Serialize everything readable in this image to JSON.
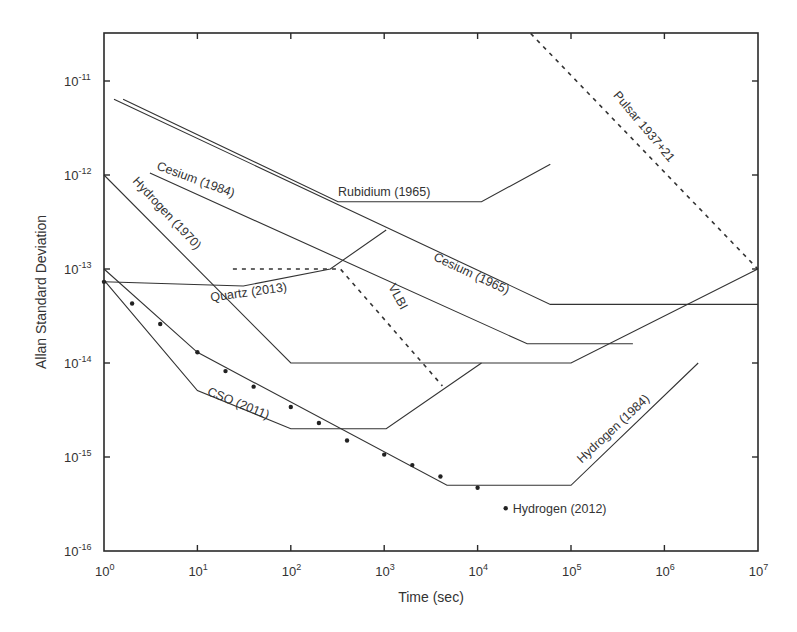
{
  "chart_data": {
    "type": "line",
    "title": "",
    "xlabel": "Time (sec)",
    "ylabel": "Allan Standard Deviation",
    "xscale": "log",
    "yscale": "log",
    "xlim": [
      1,
      10000000
    ],
    "ylim": [
      1e-16,
      3.2e-11
    ],
    "grid": false,
    "legend": "inline annotations",
    "x_ticks": [
      {
        "base": "10",
        "exp": "0",
        "value": 1
      },
      {
        "base": "10",
        "exp": "1",
        "value": 10
      },
      {
        "base": "10",
        "exp": "2",
        "value": 100
      },
      {
        "base": "10",
        "exp": "3",
        "value": 1000
      },
      {
        "base": "10",
        "exp": "4",
        "value": 10000
      },
      {
        "base": "10",
        "exp": "5",
        "value": 100000
      },
      {
        "base": "10",
        "exp": "6",
        "value": 1000000
      },
      {
        "base": "10",
        "exp": "7",
        "value": 10000000
      }
    ],
    "y_ticks": [
      {
        "base": "10",
        "exp": "-16",
        "value": 1e-16
      },
      {
        "base": "10",
        "exp": "-15",
        "value": 1e-15
      },
      {
        "base": "10",
        "exp": "-14",
        "value": 1e-14
      },
      {
        "base": "10",
        "exp": "-13",
        "value": 1e-13
      },
      {
        "base": "10",
        "exp": "-12",
        "value": 1e-12
      },
      {
        "base": "10",
        "exp": "-11",
        "value": 1e-11
      }
    ],
    "series": [
      {
        "name": "Cesium (1965)",
        "style": "solid",
        "points": [
          [
            1.28,
            6.4e-12
          ],
          [
            60000,
            4.2e-14
          ],
          [
            10000000,
            4.2e-14
          ]
        ],
        "label": {
          "text": "Cesium (1965)",
          "x": 3300,
          "y": 1.25e-13,
          "angle": 25
        }
      },
      {
        "name": "Rubidium (1965)",
        "style": "solid",
        "points": [
          [
            1.6,
            6.4e-12
          ],
          [
            320,
            5.2e-13
          ],
          [
            11000,
            5.2e-13
          ],
          [
            60000,
            1.3e-12
          ]
        ],
        "label": {
          "text": "Rubidium (1965)",
          "x": 320,
          "y": 6e-13,
          "angle": 0
        }
      },
      {
        "name": "Cesium (1984)",
        "style": "solid",
        "points": [
          [
            3.1,
            1.05e-12
          ],
          [
            34000,
            1.6e-14
          ],
          [
            460000,
            1.6e-14
          ]
        ],
        "label": {
          "text": "Cesium (1984)",
          "x": 3.6,
          "y": 1.15e-12,
          "angle": 20
        }
      },
      {
        "name": "Hydrogen (1970)",
        "style": "solid",
        "points": [
          [
            1,
            1e-12
          ],
          [
            100,
            1e-14
          ],
          [
            100000,
            1e-14
          ],
          [
            10000000,
            1e-13
          ]
        ],
        "label": {
          "text": "Hydrogen (1970)",
          "x": 2.0,
          "y": 8.5e-13,
          "angle": 47
        }
      },
      {
        "name": "Quartz (2013)",
        "style": "solid",
        "points": [
          [
            1,
            7.3e-14
          ],
          [
            31,
            6.6e-14
          ],
          [
            265,
            1e-13
          ],
          [
            1050,
            2.6e-13
          ]
        ],
        "label": {
          "text": "Quartz (2013)",
          "x": 14,
          "y": 4.5e-14,
          "angle": -8
        }
      },
      {
        "name": "VLBI",
        "style": "dashed",
        "points": [
          [
            24,
            1e-13
          ],
          [
            340,
            1e-13
          ],
          [
            4200,
            5.7e-15
          ]
        ],
        "label": {
          "text": "VLBI",
          "x": 1100,
          "y": 6.5e-14,
          "angle": 62
        }
      },
      {
        "name": "Pulsar 1937+21",
        "style": "dashed",
        "points": [
          [
            37000,
            3.2e-11
          ],
          [
            10000000,
            1e-13
          ]
        ],
        "label": {
          "text": "Pulsar 1937+21",
          "x": 280000,
          "y": 7e-12,
          "angle": 50
        }
      },
      {
        "name": "Hydrogen (1984)",
        "style": "solid",
        "points": [
          [
            1,
            1e-13
          ],
          [
            10,
            1.3e-14
          ],
          [
            4700,
            5e-16
          ],
          [
            100000,
            5e-16
          ],
          [
            2300000,
            1e-14
          ]
        ],
        "label": {
          "text": "Hydrogen (1984)",
          "x": 130000,
          "y": 8.5e-16,
          "angle": -43
        }
      },
      {
        "name": "CSO (2011)",
        "style": "solid",
        "points": [
          [
            1,
            7.6e-14
          ],
          [
            10,
            5.1e-15
          ],
          [
            100,
            2e-15
          ],
          [
            1050,
            2e-15
          ],
          [
            11000,
            1e-14
          ]
        ],
        "label": {
          "text": "CSO (2011)",
          "x": 12.5,
          "y": 4.6e-15,
          "angle": 22
        }
      }
    ],
    "scatter": {
      "name": "Hydrogen (2012)",
      "marker": "dot",
      "points": [
        [
          1,
          7.3e-14
        ],
        [
          2,
          4.3e-14
        ],
        [
          4,
          2.6e-14
        ],
        [
          10,
          1.3e-14
        ],
        [
          20,
          8.2e-15
        ],
        [
          40,
          5.6e-15
        ],
        [
          100,
          3.4e-15
        ],
        [
          200,
          2.3e-15
        ],
        [
          400,
          1.5e-15
        ],
        [
          1000,
          1.06e-15
        ],
        [
          2000,
          8.2e-16
        ],
        [
          4000,
          6.2e-16
        ],
        [
          10000,
          4.7e-16
        ]
      ],
      "label": {
        "text": "Hydrogen (2012)",
        "marker_x": 20000,
        "marker_y": 2.85e-16
      }
    }
  },
  "axes": {
    "xlabel": "Time (sec)",
    "ylabel": "Allan Standard Deviation"
  }
}
